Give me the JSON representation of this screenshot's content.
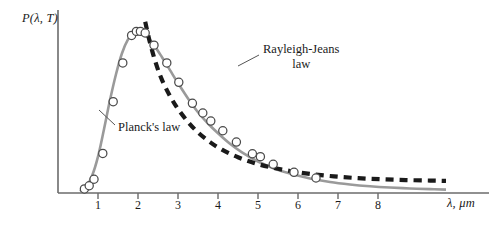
{
  "figure": {
    "background_color": "#ffffff",
    "axis_color": "#6b6b6b",
    "text_color": "#1a1a1a",
    "planck_curve_color": "#9a9a9a",
    "rayleigh_curve_color": "#1a1a1a",
    "marker_fill_color": "#ffffff",
    "marker_stroke_color": "#4a4a4a"
  },
  "axes": {
    "ylabel": "P(λ, T)",
    "xlabel": "λ, μm",
    "xtick_labels": [
      "1",
      "2",
      "3",
      "4",
      "5",
      "6",
      "7",
      "8"
    ]
  },
  "annotations": {
    "planck": "Planck's law",
    "rayleigh_line1": "Rayleigh-Jeans",
    "rayleigh_line2": "law"
  },
  "chart_data": {
    "type": "line",
    "title": "",
    "xlabel": "λ, μm",
    "ylabel": "P(λ, T)",
    "xlim": [
      0,
      9.5
    ],
    "ylim": [
      0,
      1.12
    ],
    "grid": false,
    "legend": "inline-annotations",
    "xticks": [
      1,
      2,
      3,
      4,
      5,
      6,
      7,
      8
    ],
    "yticks": [],
    "series": [
      {
        "name": "Planck's law",
        "style": "solid",
        "color": "#9a9a9a",
        "x": [
          0.55,
          0.7,
          0.85,
          1.0,
          1.15,
          1.3,
          1.45,
          1.6,
          1.75,
          1.9,
          2.05,
          2.2,
          2.4,
          2.6,
          2.8,
          3.0,
          3.25,
          3.5,
          3.75,
          4.0,
          4.3,
          4.6,
          5.0,
          5.4,
          5.8,
          6.3,
          6.8,
          7.3,
          7.8,
          8.3,
          8.8,
          9.3,
          9.7
        ],
        "y": [
          0.01,
          0.035,
          0.105,
          0.225,
          0.395,
          0.575,
          0.735,
          0.865,
          0.95,
          0.995,
          1.0,
          0.975,
          0.915,
          0.84,
          0.76,
          0.68,
          0.585,
          0.5,
          0.43,
          0.37,
          0.305,
          0.252,
          0.195,
          0.152,
          0.12,
          0.09,
          0.068,
          0.053,
          0.042,
          0.034,
          0.028,
          0.024,
          0.021
        ]
      },
      {
        "name": "Rayleigh-Jeans law",
        "style": "dashed",
        "color": "#1a1a1a",
        "x": [
          2.18,
          2.3,
          2.45,
          2.6,
          2.8,
          3.0,
          3.25,
          3.5,
          3.8,
          4.1,
          4.5,
          4.9,
          5.3,
          5.8,
          6.3,
          6.9,
          7.5,
          8.1,
          8.7,
          9.3,
          9.7
        ],
        "y": [
          1.06,
          0.93,
          0.8,
          0.7,
          0.6,
          0.52,
          0.44,
          0.375,
          0.315,
          0.268,
          0.221,
          0.186,
          0.16,
          0.136,
          0.118,
          0.103,
          0.092,
          0.085,
          0.08,
          0.077,
          0.075
        ]
      }
    ],
    "data_points": {
      "name": "measured blackbody intensity",
      "marker": "open-circle",
      "x": [
        0.66,
        0.78,
        0.9,
        1.12,
        1.38,
        1.62,
        1.84,
        1.96,
        2.06,
        2.18,
        2.4,
        2.72,
        3.02,
        3.36,
        3.62,
        3.82,
        4.12,
        4.46,
        4.86,
        5.06,
        5.38,
        5.9,
        6.45
      ],
      "y": [
        0.025,
        0.045,
        0.085,
        0.245,
        0.565,
        0.805,
        0.975,
        1.0,
        1.0,
        0.99,
        0.915,
        0.805,
        0.685,
        0.555,
        0.495,
        0.445,
        0.385,
        0.315,
        0.243,
        0.225,
        0.178,
        0.128,
        0.093
      ]
    }
  }
}
